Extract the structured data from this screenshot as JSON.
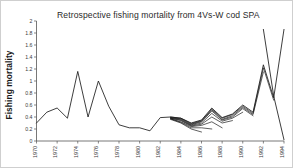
{
  "figure": {
    "name": "retrospective-fishing-mortality-figure",
    "width": 293,
    "height": 168,
    "background": "#ffffff",
    "line_color": "#1b1b1b",
    "axis_color": "#555555"
  },
  "chart_data": {
    "type": "line",
    "title": "Retrospective fishing mortality from 4Vs-W cod SPA",
    "xlabel": "",
    "ylabel": "Fishing mortality",
    "xlim": [
      1970,
      1994
    ],
    "ylim": [
      0,
      2
    ],
    "grid": false,
    "legend": null,
    "legend_position": "none",
    "y_ticks": [
      0,
      0.2,
      0.4,
      0.6,
      0.8,
      1,
      1.2,
      1.4,
      1.6,
      1.8,
      2
    ],
    "y_tick_labels": [
      "0",
      "0.2",
      "0.4",
      "0.6",
      "0.8",
      "1",
      "1.2",
      "1.4",
      "1.6",
      "1.8",
      "2"
    ],
    "x_ticks": [
      1970,
      1972,
      1974,
      1976,
      1978,
      1980,
      1982,
      1984,
      1986,
      1988,
      1990,
      1992,
      1994
    ],
    "x_tick_labels": [
      "1970",
      "1972",
      "1974",
      "1976",
      "1978",
      "1980",
      "1982",
      "1984",
      "1986",
      "1988",
      "1990",
      "1992",
      "1994"
    ],
    "x_tick_rotation": 90,
    "series": [
      {
        "name": "SPA 1994 (full series)",
        "x": [
          1970,
          1971,
          1972,
          1973,
          1974,
          1975,
          1976,
          1977,
          1978,
          1979,
          1980,
          1981,
          1982,
          1983,
          1984,
          1985,
          1986,
          1987,
          1988,
          1989,
          1990,
          1991,
          1992,
          1993,
          1994
        ],
        "values": [
          0.3,
          0.48,
          0.55,
          0.38,
          1.16,
          0.4,
          1.0,
          0.58,
          0.27,
          0.22,
          0.22,
          0.17,
          0.39,
          0.4,
          0.38,
          0.3,
          0.35,
          0.55,
          0.39,
          0.45,
          0.6,
          0.48,
          1.27,
          0.72,
          1.86
        ]
      },
      {
        "name": "SPA 1993",
        "x": [
          1983,
          1984,
          1985,
          1986,
          1987,
          1988,
          1989,
          1990,
          1991,
          1992,
          1993
        ],
        "values": [
          0.4,
          0.38,
          0.29,
          0.34,
          0.53,
          0.38,
          0.44,
          0.58,
          0.46,
          1.22,
          0.68
        ]
      },
      {
        "name": "SPA 1992",
        "x": [
          1983,
          1984,
          1985,
          1986,
          1987,
          1988,
          1989,
          1990,
          1991,
          1992
        ],
        "values": [
          0.39,
          0.37,
          0.28,
          0.33,
          0.52,
          0.36,
          0.42,
          0.56,
          0.44,
          1.15
        ]
      },
      {
        "name": "SPA 1991",
        "x": [
          1983,
          1984,
          1985,
          1986,
          1987,
          1988,
          1989,
          1990,
          1991
        ],
        "values": [
          0.39,
          0.36,
          0.27,
          0.32,
          0.5,
          0.35,
          0.4,
          0.54,
          0.42
        ]
      },
      {
        "name": "SPA 1990",
        "x": [
          1983,
          1984,
          1985,
          1986,
          1987,
          1988,
          1989,
          1990
        ],
        "values": [
          0.38,
          0.35,
          0.26,
          0.3,
          0.46,
          0.33,
          0.38,
          0.48
        ]
      },
      {
        "name": "SPA 1989",
        "x": [
          1983,
          1984,
          1985,
          1986,
          1987,
          1988,
          1989
        ],
        "values": [
          0.38,
          0.34,
          0.25,
          0.28,
          0.4,
          0.3,
          0.34
        ]
      },
      {
        "name": "SPA 1988",
        "x": [
          1983,
          1984,
          1985,
          1986,
          1987,
          1988
        ],
        "values": [
          0.37,
          0.32,
          0.24,
          0.26,
          0.32,
          0.22
        ]
      },
      {
        "name": "SPA 1987",
        "x": [
          1983,
          1984,
          1985,
          1986,
          1987
        ],
        "values": [
          0.37,
          0.31,
          0.22,
          0.22,
          0.2
        ]
      },
      {
        "name": "SPA 1986",
        "x": [
          1983,
          1984,
          1985,
          1986
        ],
        "values": [
          0.36,
          0.3,
          0.2,
          0.15
        ]
      },
      {
        "name": "SPA 1994 terminal decline",
        "x": [
          1992,
          1993,
          1994
        ],
        "values": [
          1.86,
          0.75,
          0.02
        ]
      }
    ],
    "terminal_value_1994": 0.02,
    "peak_value": 1.86,
    "peak_year": 1992
  }
}
